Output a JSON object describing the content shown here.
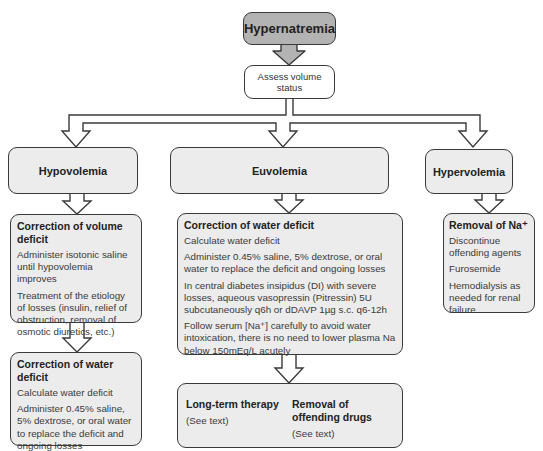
{
  "diagram": {
    "root": {
      "label": "Hypernatremia"
    },
    "assess": {
      "label": "Assess volume status"
    },
    "branches": {
      "hypovolemia": {
        "label": "Hypovolemia",
        "step1": {
          "heading": "Correction of volume deficit",
          "lines": [
            "Administer isotonic saline until hypovolemia improves",
            "Treatment of the etiology of losses (insulin, relief of obstruction, removal of osmotic diuretics, etc.)"
          ]
        },
        "step2": {
          "heading": "Correction of water deficit",
          "lines": [
            "Calculate water deficit",
            "Administer 0.45% saline, 5% dextrose, or oral water to replace the deficit and ongoing losses"
          ]
        }
      },
      "euvolemia": {
        "label": "Euvolemia",
        "step1": {
          "heading": "Correction of water deficit",
          "lines": [
            "Calculate water deficit",
            "Administer 0.45% saline, 5% dextrose, or oral water to replace the deficit and ongoing losses",
            "In central diabetes insipidus (DI) with severe losses, aqueous vasopressin (Pitressin) 5U subcutaneously q6h or dDAVP 1µg s.c. q6-12h",
            "Follow serum [Na⁺] carefully to avoid water intoxication, there is no need to lower plasma Na below 150mEq/L acutely"
          ]
        },
        "step2": {
          "left": {
            "heading": "Long-term therapy",
            "note": "(See text)"
          },
          "right": {
            "heading": "Removal of offending drugs",
            "note": "(See text)"
          }
        }
      },
      "hypervolemia": {
        "label": "Hypervolemia",
        "step1": {
          "heading": "Removal of Na⁺",
          "lines": [
            "Discontinue offending agents",
            "Furosemide",
            "Hemodialysis as needed for renal failure"
          ]
        }
      }
    },
    "colors": {
      "root_fill": "#b3b3b3",
      "box_fill": "#ececec",
      "stroke": "#3a3a3a",
      "background": "#ffffff"
    }
  }
}
